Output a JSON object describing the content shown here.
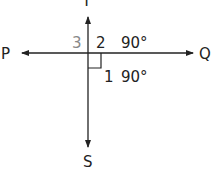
{
  "diagram": {
    "type": "perpendicular-lines",
    "points": {
      "top": "T",
      "left": "P",
      "right": "Q",
      "bottom": "S"
    },
    "angles": [
      {
        "label": "3",
        "value": ""
      },
      {
        "label": "2",
        "value": "90°"
      },
      {
        "label": "1",
        "value": "90°"
      }
    ],
    "colors": {
      "line": "#222222",
      "label": "#222222",
      "muted_label": "#888888"
    }
  }
}
